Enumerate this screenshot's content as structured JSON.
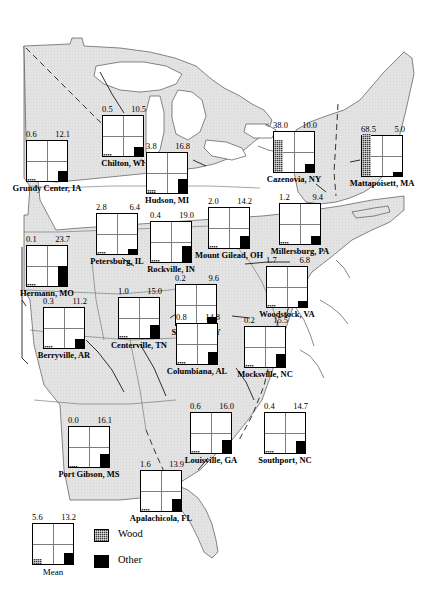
{
  "legend": {
    "mean_label": "Mean",
    "mean_wood": 5.6,
    "mean_other": 13.2,
    "wood_label": "Wood",
    "other_label": "Other",
    "wood_color": "#3b3b3b",
    "other_color": "#000000"
  },
  "chart_data": {
    "type": "bar",
    "title": "",
    "xlabel": "",
    "ylabel": "",
    "ylim": [
      0,
      50
    ],
    "grid": true,
    "legend_position": "bottom-left",
    "series": [
      {
        "name": "Wood",
        "color": "#3b3b3b"
      },
      {
        "name": "Other",
        "color": "#000000"
      }
    ],
    "categories": [
      "Grundy Center, IA",
      "Chilton, WI",
      "Hudson, MI",
      "Cazenovia, NY",
      "Mattapoisett, MA",
      "Petersburg, IL",
      "Rockville, IN",
      "Mount Gilead, OH",
      "Millersburg, PA",
      "Hermann, MO",
      "Stanford, KY",
      "Woodstock, VA",
      "Berryville, AR",
      "Centerville, TN",
      "Columbiana, AL",
      "Mocksville, NC",
      "Port Gibson, MS",
      "Louisville, GA",
      "Southport, NC",
      "Apalachicola, FL",
      "Mean"
    ],
    "wood_values": [
      0.6,
      0.5,
      3.8,
      38.0,
      68.5,
      2.8,
      0.4,
      2.0,
      1.2,
      0.1,
      0.2,
      1.7,
      0.3,
      1.0,
      0.8,
      0.2,
      0.0,
      0.6,
      0.4,
      1.6,
      5.6
    ],
    "other_values": [
      12.1,
      10.5,
      16.8,
      10.0,
      5.0,
      6.4,
      19.0,
      14.2,
      9.4,
      23.7,
      9.6,
      6.8,
      11.2,
      15.0,
      14.8,
      15.5,
      16.1,
      16.0,
      14.7,
      13.9,
      13.2
    ]
  },
  "sites": [
    {
      "name": "Grundy Center, IA",
      "wood": "0.6",
      "other": "12.1",
      "wood_v": 0.6,
      "other_v": 12.1,
      "prefix": "",
      "x": 26,
      "y": 140
    },
    {
      "name": "Chilton, WI",
      "wood": "0.5",
      "other": "10.5",
      "wood_v": 0.5,
      "other_v": 10.5,
      "prefix": "",
      "x": 102,
      "y": 115
    },
    {
      "name": "Hudson, MI",
      "wood": "3.8",
      "other": "16.8",
      "wood_v": 3.8,
      "other_v": 16.8,
      "prefix": "",
      "x": 146,
      "y": 152
    },
    {
      "name": "Cazenovia, NY",
      "wood": "38.0",
      "other": "10.0",
      "wood_v": 38.0,
      "other_v": 10.0,
      "prefix": "<",
      "x": 273,
      "y": 131
    },
    {
      "name": "Mattapoisett, MA",
      "wood": "68.5",
      "other": "5.0",
      "wood_v": 68.5,
      "other_v": 5.0,
      "prefix": "",
      "x": 361,
      "y": 135
    },
    {
      "name": "Petersburg, IL",
      "wood": "2.8",
      "other": "6.4",
      "wood_v": 2.8,
      "other_v": 6.4,
      "prefix": "",
      "x": 96,
      "y": 213
    },
    {
      "name": "Rockville, IN",
      "wood": "0.4",
      "other": "19.0",
      "wood_v": 0.4,
      "other_v": 19.0,
      "prefix": "",
      "x": 150,
      "y": 221
    },
    {
      "name": "Mount Gilead, OH",
      "wood": "2.0",
      "other": "14.2",
      "wood_v": 2.0,
      "other_v": 14.2,
      "prefix": "",
      "x": 208,
      "y": 207
    },
    {
      "name": "Millersburg, PA",
      "wood": "1.2",
      "other": "9.4",
      "wood_v": 1.2,
      "other_v": 9.4,
      "prefix": "",
      "x": 279,
      "y": 203
    },
    {
      "name": "Hermann, MO",
      "wood": "0.1",
      "other": "23.7",
      "wood_v": 0.1,
      "other_v": 23.7,
      "prefix": "",
      "x": 26,
      "y": 245
    },
    {
      "name": "Stanford, KY",
      "wood": "0.2",
      "other": "9.6",
      "wood_v": 0.2,
      "other_v": 9.6,
      "prefix": "",
      "x": 175,
      "y": 284
    },
    {
      "name": "Woodstock, VA",
      "wood": "1.7",
      "other": "6.8",
      "wood_v": 1.7,
      "other_v": 6.8,
      "prefix": "",
      "x": 266,
      "y": 266
    },
    {
      "name": "Berryville, AR",
      "wood": "0.3",
      "other": "11.2",
      "wood_v": 0.3,
      "other_v": 11.2,
      "prefix": "",
      "x": 43,
      "y": 307
    },
    {
      "name": "Centerville, TN",
      "wood": "1.0",
      "other": "15.0",
      "wood_v": 1.0,
      "other_v": 15.0,
      "prefix": "",
      "x": 118,
      "y": 297
    },
    {
      "name": "Columbiana, AL",
      "wood": "0.8",
      "other": "14.8",
      "wood_v": 0.8,
      "other_v": 14.8,
      "prefix": "",
      "x": 176,
      "y": 323
    },
    {
      "name": "Mocksville, NC",
      "wood": "0.2",
      "other": "15.5",
      "wood_v": 0.2,
      "other_v": 15.5,
      "prefix": "",
      "x": 244,
      "y": 326
    },
    {
      "name": "Port Gibson, MS",
      "wood": "0.0",
      "other": "16.1",
      "wood_v": 0.0,
      "other_v": 16.1,
      "prefix": "",
      "x": 68,
      "y": 426
    },
    {
      "name": "Louisville, GA",
      "wood": "0.6",
      "other": "16.0",
      "wood_v": 0.6,
      "other_v": 16.0,
      "prefix": "",
      "x": 190,
      "y": 412
    },
    {
      "name": "Southport, NC",
      "wood": "0.4",
      "other": "14.7",
      "wood_v": 0.4,
      "other_v": 14.7,
      "prefix": "",
      "x": 264,
      "y": 412
    },
    {
      "name": "Apalachicola, FL",
      "wood": "1.6",
      "other": "13.9",
      "wood_v": 1.6,
      "other_v": 13.9,
      "prefix": "",
      "x": 140,
      "y": 470
    }
  ]
}
